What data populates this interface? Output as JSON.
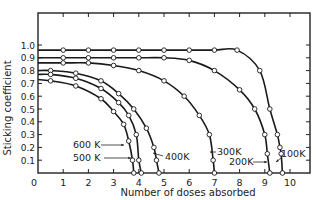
{
  "chart_data": {
    "type": "line",
    "title": "",
    "xlabel": "Number of doses absorbed",
    "ylabel": "Sticking coefficient",
    "xlim": [
      0,
      11
    ],
    "ylim": [
      0,
      1.1
    ],
    "grid": false,
    "legend": "inline annotations",
    "x_ticks": [
      "0",
      "1",
      "2",
      "3",
      "4",
      "5",
      "6",
      "7",
      "8",
      "9",
      "10"
    ],
    "y_ticks": [
      "0.1",
      "0.2",
      "0.3",
      "0.4",
      "0.5",
      "0.6",
      "0.7",
      "0.8",
      "0.9",
      "1.0"
    ],
    "series": [
      {
        "name": "100K",
        "x": [
          0,
          1,
          2,
          3,
          4,
          5,
          6,
          7,
          7.9,
          8.8,
          9.2,
          9.5,
          9.6,
          9.65,
          9.7
        ],
        "y": [
          0.96,
          0.96,
          0.96,
          0.96,
          0.96,
          0.96,
          0.96,
          0.96,
          0.96,
          0.8,
          0.5,
          0.3,
          0.2,
          0.15,
          0.0
        ]
      },
      {
        "name": "200K",
        "x": [
          0,
          1,
          2,
          3,
          4,
          5,
          6,
          7,
          8,
          8.6,
          9.0,
          9.1,
          9.2
        ],
        "y": [
          0.9,
          0.9,
          0.9,
          0.9,
          0.9,
          0.9,
          0.88,
          0.8,
          0.65,
          0.5,
          0.3,
          0.15,
          0.0
        ]
      },
      {
        "name": "300K",
        "x": [
          0,
          1,
          2,
          3,
          4,
          5,
          5.8,
          6.4,
          6.8,
          6.95,
          7.0
        ],
        "y": [
          0.86,
          0.86,
          0.86,
          0.84,
          0.8,
          0.72,
          0.6,
          0.45,
          0.3,
          0.1,
          0.0
        ]
      },
      {
        "name": "400K",
        "x": [
          0,
          0.5,
          1.5,
          2.5,
          3.2,
          3.8,
          4.3,
          4.6,
          4.7,
          4.8
        ],
        "y": [
          0.8,
          0.8,
          0.78,
          0.72,
          0.62,
          0.5,
          0.35,
          0.2,
          0.1,
          0.0
        ]
      },
      {
        "name": "500K",
        "x": [
          0,
          0.5,
          1.5,
          2.5,
          3.2,
          3.6,
          3.9,
          4.0,
          4.1
        ],
        "y": [
          0.77,
          0.77,
          0.74,
          0.66,
          0.55,
          0.45,
          0.3,
          0.1,
          0.0
        ]
      },
      {
        "name": "600K",
        "x": [
          0,
          0.5,
          1.5,
          2.5,
          3.0,
          3.4,
          3.6,
          3.75,
          3.8
        ],
        "y": [
          0.73,
          0.72,
          0.68,
          0.58,
          0.48,
          0.38,
          0.25,
          0.1,
          0.0
        ]
      }
    ],
    "annotations": [
      "600K",
      "500K",
      "400K",
      "300K",
      "200K",
      "100K"
    ]
  },
  "labels": {
    "xlabel": "Number of doses absorbed",
    "ylabel": "Sticking coefficient",
    "origin": "0",
    "k600": "600 K",
    "k500": "500 K",
    "k400": "400K",
    "k300": "300K",
    "k200": "200K",
    "k100": "100K"
  }
}
